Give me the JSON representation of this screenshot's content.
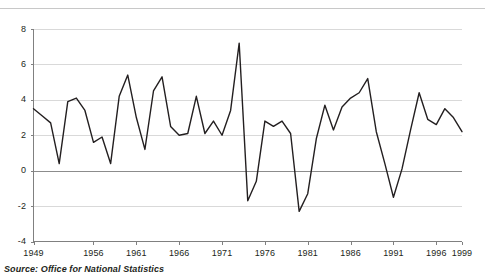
{
  "source_note": "Source: Office for National Statistics",
  "chart_data": {
    "type": "line",
    "title": "",
    "subtitle": "",
    "xlabel": "",
    "ylabel": "",
    "grid": true,
    "legend": "none",
    "xlim": [
      1949,
      1999
    ],
    "ylim": [
      -4,
      8
    ],
    "yticks": [
      -4,
      -2,
      0,
      2,
      4,
      6,
      8
    ],
    "ytick_labels": [
      "-4",
      "-2",
      "0",
      "2",
      "4",
      "6",
      "8"
    ],
    "xticks": [
      1949,
      1956,
      1961,
      1966,
      1971,
      1976,
      1981,
      1986,
      1991,
      1996,
      1999
    ],
    "xtick_labels": [
      "1949",
      "1956",
      "1961",
      "1966",
      "1971",
      "1976",
      "1981",
      "1986",
      "1991",
      "1996",
      "1999"
    ],
    "zero_line": 0,
    "series": [
      {
        "name": "Annual growth",
        "color": "#231f20",
        "x": [
          1949,
          1950,
          1951,
          1952,
          1953,
          1954,
          1955,
          1956,
          1957,
          1958,
          1959,
          1960,
          1961,
          1962,
          1963,
          1964,
          1965,
          1966,
          1967,
          1968,
          1969,
          1970,
          1971,
          1972,
          1973,
          1974,
          1975,
          1976,
          1977,
          1978,
          1979,
          1980,
          1981,
          1982,
          1983,
          1984,
          1985,
          1986,
          1987,
          1988,
          1989,
          1990,
          1991,
          1992,
          1993,
          1994,
          1995,
          1996,
          1997,
          1998,
          1999
        ],
        "values": [
          3.5,
          3.1,
          2.7,
          0.4,
          3.9,
          4.1,
          3.4,
          1.6,
          1.9,
          0.4,
          4.2,
          5.4,
          3.0,
          1.2,
          4.5,
          5.3,
          2.5,
          2.0,
          2.1,
          4.2,
          2.1,
          2.8,
          2.0,
          3.4,
          7.2,
          -1.7,
          -0.6,
          2.8,
          2.5,
          2.8,
          2.1,
          -2.3,
          -1.3,
          1.8,
          3.7,
          2.3,
          3.6,
          4.1,
          4.4,
          5.2,
          2.2,
          0.4,
          -1.5,
          0.1,
          2.3,
          4.4,
          2.9,
          2.6,
          3.5,
          3.0,
          2.2
        ]
      }
    ]
  }
}
